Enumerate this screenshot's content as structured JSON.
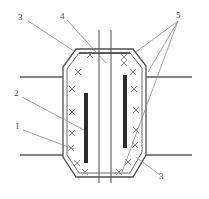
{
  "figure": {
    "domain": "technical-line-drawing",
    "canvas": {
      "width": 209,
      "height": 199,
      "background": "#ffffff"
    }
  },
  "colors": {
    "outline": "#4f4f4f",
    "inner_outline": "#6b6b6b",
    "hatch": "#7d7d7d",
    "bar_fill": "#2b2b2b",
    "leader": "#8a8a8a",
    "flange": "#5a5a5a",
    "label_text": "#4a4a4a",
    "background": "#ffffff"
  },
  "callouts": [
    {
      "id": "callout-3-top",
      "label": "3",
      "x": 20,
      "y": 16,
      "leader_to": {
        "x": 72,
        "y": 48
      }
    },
    {
      "id": "callout-4",
      "label": "4",
      "x": 61,
      "y": 15,
      "leader_to": {
        "x": 105,
        "y": 62
      }
    },
    {
      "id": "callout-5",
      "label": "5",
      "x": 178,
      "y": 14,
      "leader_to": {
        "x": 137,
        "y": 55
      }
    },
    {
      "id": "callout-2",
      "label": "2",
      "x": 15,
      "y": 92,
      "leader_to": {
        "x": 82,
        "y": 128
      }
    },
    {
      "id": "callout-1",
      "label": "1",
      "x": 16,
      "y": 125,
      "leader_to": {
        "x": 73,
        "y": 148
      }
    },
    {
      "id": "callout-3-bottom",
      "label": "3",
      "x": 160,
      "y": 176,
      "leader_to": {
        "x": 140,
        "y": 160
      }
    }
  ],
  "geometry": {
    "outer_body": {
      "description": "octagonal chamfered outer shell",
      "points": "76,49 133,49 146,66 146,155 133,177 76,177 63,157 63,67"
    },
    "inner_body": {
      "description": "inner offset shell following outer contour",
      "points": "79,53 130,53 142,68 142,153 130,173 79,173 67,156 67,69"
    },
    "center_lines": [
      {
        "id": "center-line-left",
        "x": 99,
        "y1": 30,
        "y2": 183
      },
      {
        "id": "center-line-right",
        "x": 111,
        "y1": 30,
        "y2": 183
      }
    ],
    "bars": [
      {
        "id": "bar-left",
        "x": 84,
        "y": 93,
        "width": 4,
        "height": 70
      },
      {
        "id": "bar-right",
        "x": 123,
        "y": 75,
        "width": 4,
        "height": 73
      }
    ],
    "flanges": [
      {
        "id": "flange-top-left",
        "x1": 20,
        "y1": 77,
        "x2": 63,
        "y2": 77
      },
      {
        "id": "flange-top-right",
        "x1": 146,
        "y1": 77,
        "x2": 192,
        "y2": 77
      },
      {
        "id": "flange-bottom-left",
        "x1": 20,
        "y1": 155,
        "x2": 63,
        "y2": 155
      },
      {
        "id": "flange-bottom-right",
        "x1": 146,
        "y1": 155,
        "x2": 192,
        "y2": 155
      }
    ],
    "hatch_marks_left": [
      {
        "x": 90,
        "y": 55
      },
      {
        "x": 78,
        "y": 72
      },
      {
        "x": 72,
        "y": 89
      },
      {
        "x": 72,
        "y": 112
      },
      {
        "x": 72,
        "y": 133
      },
      {
        "x": 71,
        "y": 148
      },
      {
        "x": 77,
        "y": 163
      },
      {
        "x": 85,
        "y": 172
      }
    ],
    "hatch_marks_right": [
      {
        "x": 124,
        "y": 57
      },
      {
        "x": 124,
        "y": 62
      },
      {
        "x": 133,
        "y": 72
      },
      {
        "x": 134,
        "y": 89
      },
      {
        "x": 136,
        "y": 110
      },
      {
        "x": 136,
        "y": 130
      },
      {
        "x": 135,
        "y": 145
      },
      {
        "x": 128,
        "y": 162
      },
      {
        "x": 119,
        "y": 172
      }
    ]
  }
}
